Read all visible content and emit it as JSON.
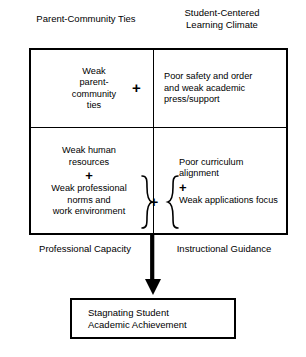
{
  "diagram": {
    "captions": {
      "top_left": "Parent-Community Ties",
      "top_right": "Student-Centered\nLearning Climate",
      "bottom_left": "Professional Capacity",
      "bottom_right": "Instructional Guidance"
    },
    "cells": {
      "parent_ties": {
        "text": "Weak\nparent-\ncommunity\nties"
      },
      "learning_climate": {
        "text": "Poor safety and order\nand weak academic\npress/support"
      },
      "professional_capacity": {
        "line1": "Weak human\nresources",
        "operator": "+",
        "line2": "Weak professional\nnorms and\nwork environment"
      },
      "instructional_guidance": {
        "line1": "Poor curriculum\nalignment",
        "operator": "+",
        "line2": "Weak applications focus"
      }
    },
    "operators": {
      "top_plus": "+",
      "middle_plus": "+",
      "left_brace": "}",
      "right_brace": "{"
    },
    "outcome": {
      "text": "Stagnating Student\nAcademic Achievement"
    },
    "colors": {
      "stroke": "#000000",
      "background": "#ffffff",
      "text": "#000000"
    }
  }
}
